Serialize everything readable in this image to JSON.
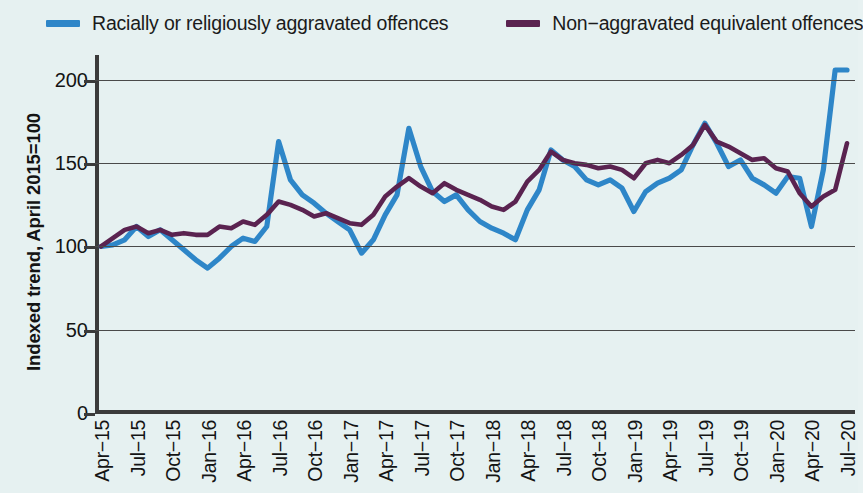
{
  "legend": {
    "items": [
      {
        "label": "Racially or religiously aggravated offences",
        "color": "#2e86c8",
        "swatch_name": "legend-swatch-blue"
      },
      {
        "label": "Non−aggravated equivalent offences",
        "color": "#5a2350",
        "swatch_name": "legend-swatch-purple"
      }
    ]
  },
  "axes": {
    "y_title": "Indexed trend, April 2015=100",
    "y_ticks": [
      "0",
      "50",
      "100",
      "150",
      "200"
    ],
    "x_ticks": [
      "Apr−15",
      "Jul−15",
      "Oct−15",
      "Jan−16",
      "Apr−16",
      "Jul−16",
      "Oct−16",
      "Jan−17",
      "Apr−17",
      "Jul−17",
      "Oct−17",
      "Jan−18",
      "Apr−18",
      "Jul−18",
      "Oct−18",
      "Jan−19",
      "Apr−19",
      "Jul−19",
      "Oct−19",
      "Jan−20",
      "Apr−20",
      "Jul−20"
    ]
  },
  "chart_data": {
    "type": "line",
    "title": "",
    "subtitle": "",
    "xlabel": "",
    "ylabel": "Indexed trend, April 2015=100",
    "ylim": [
      0,
      215
    ],
    "yticks": [
      0,
      50,
      100,
      150,
      200
    ],
    "grid": true,
    "legend_position": "top",
    "x": [
      "Apr-15",
      "May-15",
      "Jun-15",
      "Jul-15",
      "Aug-15",
      "Sep-15",
      "Oct-15",
      "Nov-15",
      "Dec-15",
      "Jan-16",
      "Feb-16",
      "Mar-16",
      "Apr-16",
      "May-16",
      "Jun-16",
      "Jul-16",
      "Aug-16",
      "Sep-16",
      "Oct-16",
      "Nov-16",
      "Dec-16",
      "Jan-17",
      "Feb-17",
      "Mar-17",
      "Apr-17",
      "May-17",
      "Jun-17",
      "Jul-17",
      "Aug-17",
      "Sep-17",
      "Oct-17",
      "Nov-17",
      "Dec-17",
      "Jan-18",
      "Feb-18",
      "Mar-18",
      "Apr-18",
      "May-18",
      "Jun-18",
      "Jul-18",
      "Aug-18",
      "Sep-18",
      "Oct-18",
      "Nov-18",
      "Dec-18",
      "Jan-19",
      "Feb-19",
      "Mar-19",
      "Apr-19",
      "May-19",
      "Jun-19",
      "Jul-19",
      "Aug-19",
      "Sep-19",
      "Oct-19",
      "Nov-19",
      "Dec-19",
      "Jan-20",
      "Feb-20",
      "Mar-20",
      "Apr-20",
      "May-20",
      "Jun-20",
      "Jul-20"
    ],
    "series": [
      {
        "name": "Racially or religiously aggravated offences",
        "color": "#2e86c8",
        "values": [
          100,
          101,
          104,
          112,
          106,
          110,
          104,
          98,
          92,
          87,
          93,
          100,
          105,
          103,
          112,
          163,
          140,
          131,
          126,
          120,
          115,
          110,
          96,
          104,
          119,
          131,
          171,
          148,
          133,
          127,
          131,
          122,
          115,
          111,
          108,
          104,
          122,
          134,
          158,
          152,
          148,
          140,
          137,
          140,
          135,
          121,
          133,
          138,
          141,
          146,
          161,
          174,
          162,
          148,
          152,
          141,
          137,
          132,
          142,
          141,
          112,
          146,
          206,
          206
        ]
      },
      {
        "name": "Non-aggravated equivalent offences",
        "color": "#5a2350",
        "values": [
          100,
          105,
          110,
          112,
          108,
          110,
          107,
          108,
          107,
          107,
          112,
          111,
          115,
          113,
          119,
          127,
          125,
          122,
          118,
          120,
          117,
          114,
          113,
          119,
          130,
          136,
          141,
          136,
          132,
          138,
          134,
          131,
          128,
          124,
          122,
          127,
          139,
          146,
          157,
          152,
          150,
          149,
          147,
          148,
          146,
          141,
          150,
          152,
          150,
          155,
          161,
          173,
          163,
          160,
          156,
          152,
          153,
          147,
          145,
          132,
          124,
          130,
          134,
          162
        ]
      }
    ]
  }
}
